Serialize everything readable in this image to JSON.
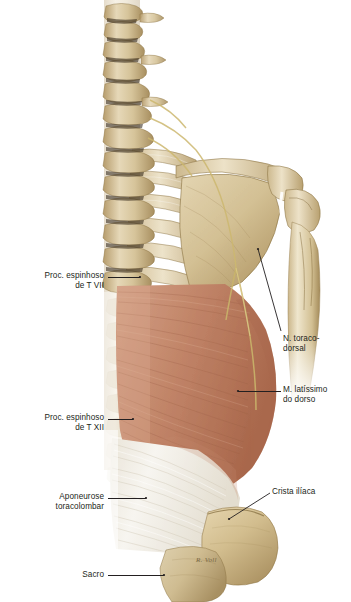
{
  "plate": {
    "title": "Musculatura superficial do dorso — M. latíssimo do dorso",
    "width": 351,
    "height": 602,
    "background": "#ffffff",
    "signature": "R. Voll"
  },
  "palette": {
    "bone_light": "#efe4cb",
    "bone_mid": "#d9c79f",
    "bone_dark": "#b39a68",
    "bone_shadow": "#8c7444",
    "muscle_light": "#cf9b80",
    "muscle_mid": "#bd7f63",
    "muscle_dark": "#9c5f46",
    "fascia_white": "#f4f1ea",
    "fascia_shade": "#ddd7c9",
    "nerve_yellow": "#d8c57a",
    "leader_line": "#231f20",
    "text": "#231f20"
  },
  "labels": [
    {
      "id": "proc-espinhoso-t7",
      "text": "Proc. espinhoso\nde T VII",
      "side": "left",
      "align": "right",
      "x": 8,
      "y": 271,
      "width": 96,
      "leader": {
        "x1": 108,
        "y1": 277,
        "x2": 140,
        "y2": 277
      }
    },
    {
      "id": "proc-espinhoso-t12",
      "text": "Proc. espinhoso\nde T XII",
      "side": "left",
      "align": "right",
      "x": 8,
      "y": 413,
      "width": 96,
      "leader": {
        "x1": 108,
        "y1": 419,
        "x2": 133,
        "y2": 419
      }
    },
    {
      "id": "aponeurose-toracolombar",
      "text": "Aponeurose\ntoracolombar",
      "side": "left",
      "align": "right",
      "x": 8,
      "y": 492,
      "width": 96,
      "leader": {
        "x1": 108,
        "y1": 498,
        "x2": 146,
        "y2": 498
      }
    },
    {
      "id": "sacro",
      "text": "Sacro",
      "side": "left",
      "align": "right",
      "x": 28,
      "y": 570,
      "width": 76,
      "leader": {
        "x1": 108,
        "y1": 575,
        "x2": 164,
        "y2": 575
      }
    },
    {
      "id": "nervo-toracodorsal",
      "text": "N. toraco-\ndorsal",
      "side": "right",
      "align": "left",
      "x": 283,
      "y": 334,
      "width": 66,
      "leader": {
        "x1": 281,
        "y1": 331,
        "x2": 258,
        "y2": 249
      }
    },
    {
      "id": "musculo-latissimo-do-dorso",
      "text": "M. latíssimo\ndo dorso",
      "side": "right",
      "align": "left",
      "x": 283,
      "y": 385,
      "width": 66,
      "leader": {
        "x1": 281,
        "y1": 391,
        "x2": 238,
        "y2": 391
      }
    },
    {
      "id": "crista-iliaca",
      "text": "Crista ilíaca",
      "side": "right",
      "align": "left",
      "x": 272,
      "y": 487,
      "width": 76,
      "leader": {
        "x1": 270,
        "y1": 493,
        "x2": 229,
        "y2": 519
      }
    }
  ],
  "structures": [
    {
      "id": "vertebral-column",
      "name": "Coluna vertebral (vert. cervicais e torácicas)",
      "tissue": "bone"
    },
    {
      "id": "ribs",
      "name": "Costelas",
      "tissue": "bone"
    },
    {
      "id": "scapula",
      "name": "Escápula",
      "tissue": "bone"
    },
    {
      "id": "acromion",
      "name": "Acrômio",
      "tissue": "bone"
    },
    {
      "id": "clavicle",
      "name": "Clavícula",
      "tissue": "bone"
    },
    {
      "id": "humerus",
      "name": "Úmero",
      "tissue": "bone"
    },
    {
      "id": "latissimus-dorsi",
      "name": "M. latíssimo do dorso",
      "tissue": "muscle"
    },
    {
      "id": "thoracolumbar-aponeurosis",
      "name": "Aponeurose toracolombar",
      "tissue": "fascia"
    },
    {
      "id": "iliac-crest",
      "name": "Crista ilíaca",
      "tissue": "bone"
    },
    {
      "id": "sacrum",
      "name": "Sacro",
      "tissue": "bone"
    },
    {
      "id": "thoracodorsal-nerve",
      "name": "N. toracodorsal",
      "tissue": "nerve"
    }
  ]
}
